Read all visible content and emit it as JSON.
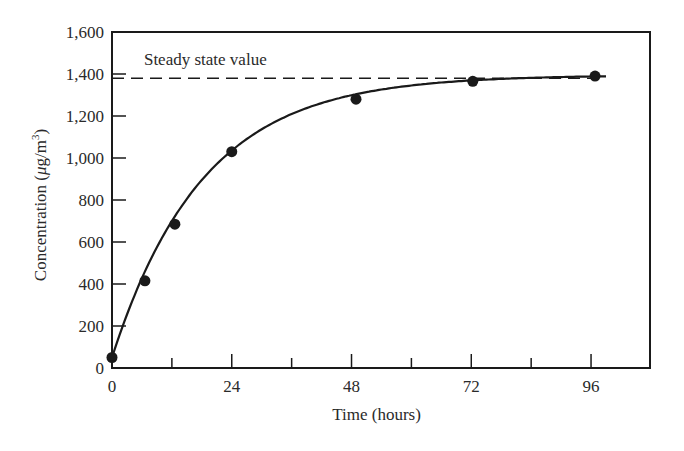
{
  "chart_data": {
    "type": "line",
    "title": "",
    "xlabel": "Time (hours)",
    "ylabel": "Concentration (μg/m³)",
    "ylabel_parts": {
      "text": "Concentration (",
      "mu": "μ",
      "rest": "g/m",
      "sup": "3",
      "close": ")"
    },
    "xlim": [
      0,
      108
    ],
    "ylim": [
      0,
      1600
    ],
    "x_ticks": [
      0,
      24,
      48,
      72,
      96
    ],
    "x_tick_labels": [
      "0",
      "24",
      "48",
      "72",
      "96"
    ],
    "x_minor_ticks": [
      12,
      36,
      60,
      84
    ],
    "y_ticks": [
      0,
      200,
      400,
      600,
      800,
      1000,
      1200,
      1400,
      1600
    ],
    "y_tick_labels": [
      "0",
      "200",
      "400",
      "600",
      "800",
      "1,000",
      "1,200",
      "1,400",
      "1,600"
    ],
    "grid": false,
    "legend": null,
    "series": [
      {
        "name": "Measured concentration",
        "x": [
          0,
          6.6,
          12.6,
          24,
          48.9,
          72.3,
          96.8
        ],
        "values": [
          50,
          415,
          685,
          1030,
          1280,
          1365,
          1390
        ],
        "marker": "filled-circle",
        "line": "smooth solid"
      }
    ],
    "reference_lines": [
      {
        "type": "horizontal",
        "y": 1380,
        "style": "dashed",
        "label": "Steady state value"
      }
    ],
    "annotations": [
      {
        "text": "Steady state value",
        "x": 6,
        "y": 1460
      }
    ]
  },
  "colors": {
    "ink": "#1a1a1a",
    "text": "#2a2a2a",
    "background": "#ffffff"
  }
}
